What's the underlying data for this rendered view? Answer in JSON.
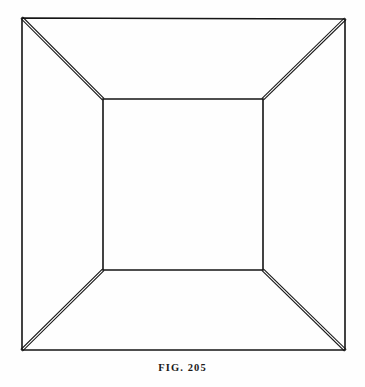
{
  "page": {
    "background_color": "#fefefe",
    "ink_color": "#151515",
    "width": 365,
    "height": 387
  },
  "figure": {
    "name": "truncated-pyramid-perspective-illusion",
    "stroke_color": "#151515",
    "outer_square": {
      "stroke_width": 1.6,
      "double_line": false,
      "points": [
        {
          "x": 22,
          "y": 18
        },
        {
          "x": 345,
          "y": 19
        },
        {
          "x": 345,
          "y": 350
        },
        {
          "x": 22,
          "y": 350
        }
      ]
    },
    "inner_rectangle": {
      "stroke_width": 1.6,
      "double_line": false,
      "points": [
        {
          "x": 103,
          "y": 99
        },
        {
          "x": 263,
          "y": 99
        },
        {
          "x": 263,
          "y": 270
        },
        {
          "x": 103,
          "y": 270
        }
      ]
    },
    "diagonals": {
      "stroke_width": 1.1,
      "double_line": true,
      "gap": 2.2,
      "edges": [
        {
          "name": "diagonal-top-left",
          "x1": 22,
          "y1": 18,
          "x2": 103,
          "y2": 99
        },
        {
          "name": "diagonal-top-right",
          "x1": 345,
          "y1": 19,
          "x2": 263,
          "y2": 99
        },
        {
          "name": "diagonal-bottom-right",
          "x1": 345,
          "y1": 350,
          "x2": 263,
          "y2": 270
        },
        {
          "name": "diagonal-bottom-left",
          "x1": 22,
          "y1": 350,
          "x2": 103,
          "y2": 270
        }
      ]
    }
  },
  "caption": {
    "text": "FIG. 205",
    "label": "FIG.",
    "number": "205"
  }
}
